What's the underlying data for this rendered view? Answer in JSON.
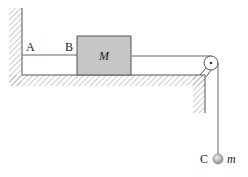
{
  "diagram": {
    "type": "physics-mechanics",
    "labels": {
      "point_a": "A",
      "point_b": "B",
      "block": "M",
      "point_c": "C",
      "hanging_mass": "m"
    },
    "colors": {
      "block_fill": "#c6c6c6",
      "line": "#555555",
      "hatch": "#9a9a9a",
      "ball": "#b8b8b8"
    }
  }
}
